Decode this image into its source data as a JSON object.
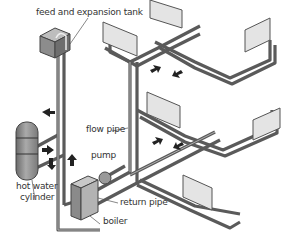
{
  "diagram": {
    "labels": {
      "tank": "feed and expansion tank",
      "flow_pipe": "flow pipe",
      "pump": "pump",
      "cylinder_line1": "hot water",
      "cylinder_line2": "cylinder",
      "return_pipe": "return pipe",
      "boiler": "boiler"
    },
    "components": [
      "feed and expansion tank",
      "hot water cylinder",
      "boiler",
      "pump",
      "flow pipe",
      "return pipe",
      "radiators"
    ],
    "radiator_count": 6,
    "colors": {
      "pipe_outline": "#555555",
      "pipe_fill": "#a8a8a8",
      "radiator_face": "#e2e2e2",
      "tank": "#8a8a8a",
      "arrow": "#222222"
    }
  }
}
